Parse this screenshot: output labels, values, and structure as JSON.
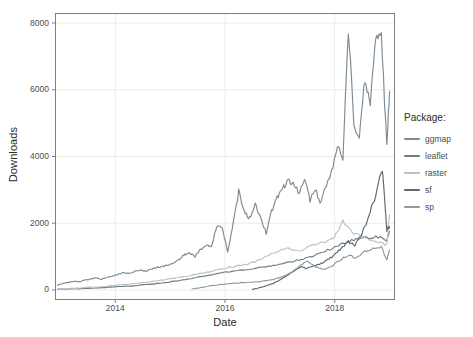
{
  "chart_data": {
    "type": "line",
    "title": "",
    "xlabel": "Date",
    "ylabel": "Downloads",
    "xlim": [
      2012.9,
      2019.1
    ],
    "ylim": [
      -300,
      8300
    ],
    "yticks": [
      0,
      2000,
      4000,
      6000,
      8000
    ],
    "ytick_labels": [
      "0",
      "2000",
      "4000",
      "6000",
      "8000"
    ],
    "xticks": [
      2014,
      2016,
      2018
    ],
    "xtick_labels": [
      "2014",
      "2016",
      "2018"
    ],
    "grid": true,
    "grid_color": "#ebebeb",
    "panel_background": "#ffffff",
    "panel_border_color": "#808080",
    "legend": {
      "title": "Package:",
      "position": "right",
      "entries": [
        "ggmap",
        "leaflet",
        "raster",
        "sf",
        "sp"
      ]
    },
    "series": [
      {
        "name": "ggmap",
        "color": "#7e8a93",
        "x": [
          2012.95,
          2013.05,
          2013.15,
          2013.25,
          2013.35,
          2013.45,
          2013.55,
          2013.65,
          2013.75,
          2013.85,
          2013.95,
          2014.05,
          2014.15,
          2014.25,
          2014.35,
          2014.45,
          2014.55,
          2014.65,
          2014.75,
          2014.85,
          2014.95,
          2015.05,
          2015.15,
          2015.25,
          2015.35,
          2015.45,
          2015.55,
          2015.65,
          2015.75,
          2015.85,
          2015.95,
          2016.05,
          2016.15,
          2016.25,
          2016.35,
          2016.45,
          2016.55,
          2016.65,
          2016.75,
          2016.85,
          2016.95,
          2017.05,
          2017.15,
          2017.25,
          2017.35,
          2017.45,
          2017.55,
          2017.65,
          2017.75,
          2017.85,
          2017.95,
          2018.05,
          2018.15,
          2018.25,
          2018.35,
          2018.45,
          2018.55,
          2018.65,
          2018.75,
          2018.85,
          2018.95,
          2019.0
        ],
        "y": [
          150,
          200,
          230,
          260,
          250,
          300,
          330,
          360,
          320,
          380,
          420,
          470,
          520,
          500,
          560,
          600,
          560,
          620,
          680,
          700,
          740,
          800,
          900,
          1050,
          1100,
          1000,
          1200,
          1350,
          1300,
          1900,
          1850,
          1150,
          2000,
          2950,
          2350,
          2150,
          2550,
          2200,
          1700,
          2350,
          2750,
          3050,
          3250,
          3150,
          2950,
          3300,
          2700,
          3000,
          2600,
          3150,
          3600,
          4350,
          3950,
          7850,
          5050,
          4500,
          6300,
          5600,
          7650,
          7700,
          4300,
          5950
        ]
      },
      {
        "name": "leaflet",
        "color": "#6f7d86",
        "x": [
          2012.95,
          2013.15,
          2013.35,
          2013.55,
          2013.75,
          2013.95,
          2014.15,
          2014.35,
          2014.55,
          2014.75,
          2014.95,
          2015.15,
          2015.35,
          2015.55,
          2015.75,
          2015.95,
          2016.15,
          2016.35,
          2016.55,
          2016.75,
          2016.95,
          2017.15,
          2017.35,
          2017.55,
          2017.75,
          2017.95,
          2018.15,
          2018.35,
          2018.55,
          2018.75,
          2018.95,
          2019.0
        ],
        "y": [
          20,
          30,
          40,
          55,
          70,
          90,
          110,
          130,
          160,
          190,
          230,
          280,
          330,
          400,
          450,
          520,
          560,
          600,
          650,
          700,
          760,
          830,
          900,
          1000,
          1100,
          1250,
          1400,
          1500,
          1550,
          1600,
          1500,
          1750
        ]
      },
      {
        "name": "raster",
        "color": "#b9c1c7",
        "x": [
          2012.95,
          2013.15,
          2013.35,
          2013.55,
          2013.75,
          2013.95,
          2014.15,
          2014.35,
          2014.55,
          2014.75,
          2014.95,
          2015.15,
          2015.35,
          2015.55,
          2015.75,
          2015.95,
          2016.15,
          2016.35,
          2016.55,
          2016.75,
          2016.95,
          2017.15,
          2017.35,
          2017.55,
          2017.75,
          2017.95,
          2018.15,
          2018.35,
          2018.55,
          2018.75,
          2018.95,
          2019.0
        ],
        "y": [
          25,
          45,
          60,
          80,
          100,
          130,
          160,
          190,
          230,
          270,
          320,
          380,
          430,
          500,
          560,
          640,
          700,
          760,
          850,
          1000,
          1150,
          1250,
          1150,
          1300,
          1400,
          1500,
          2050,
          1700,
          1550,
          1450,
          1350,
          2250
        ]
      },
      {
        "name": "sf",
        "color": "#5c6970",
        "x": [
          2016.5,
          2016.62,
          2016.75,
          2016.88,
          2017.0,
          2017.12,
          2017.25,
          2017.37,
          2017.5,
          2017.62,
          2017.75,
          2017.87,
          2018.0,
          2018.12,
          2018.25,
          2018.37,
          2018.5,
          2018.62,
          2018.75,
          2018.87,
          2018.95,
          2019.0
        ],
        "y": [
          20,
          60,
          120,
          200,
          300,
          420,
          560,
          700,
          640,
          720,
          800,
          900,
          1050,
          1250,
          1450,
          1350,
          1700,
          2200,
          2850,
          3650,
          1800,
          1900
        ]
      },
      {
        "name": "sp",
        "color": "#8f9aa2",
        "x": [
          2015.4,
          2015.55,
          2015.7,
          2015.85,
          2016.0,
          2016.15,
          2016.3,
          2016.45,
          2016.6,
          2016.75,
          2016.9,
          2017.05,
          2017.2,
          2017.35,
          2017.5,
          2017.65,
          2017.8,
          2017.95,
          2018.1,
          2018.25,
          2018.4,
          2018.55,
          2018.7,
          2018.85,
          2018.95,
          2019.0
        ],
        "y": [
          30,
          70,
          110,
          150,
          180,
          200,
          220,
          230,
          250,
          280,
          320,
          400,
          520,
          700,
          880,
          700,
          620,
          720,
          900,
          1050,
          950,
          1150,
          1250,
          1300,
          900,
          1200
        ]
      }
    ]
  }
}
